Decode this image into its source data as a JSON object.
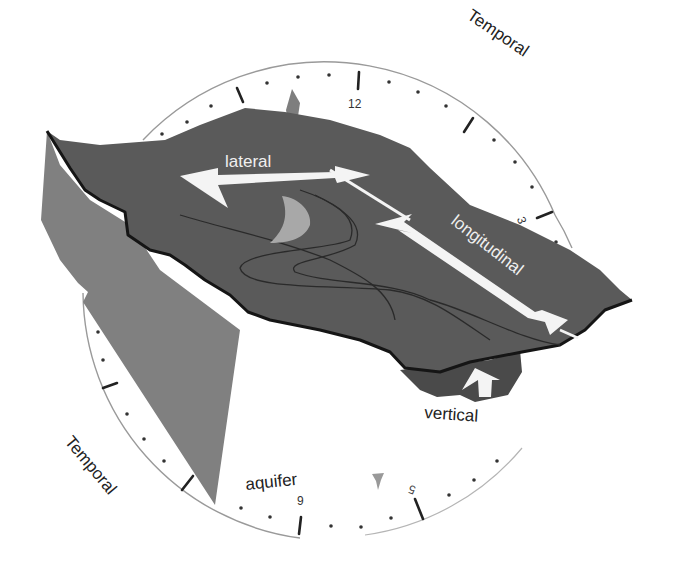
{
  "diagram": {
    "labels": {
      "temporal_top": "Temporal",
      "temporal_bottom": "Temporal",
      "lateral": "lateral",
      "longitudinal": "longitudinal",
      "vertical": "vertical",
      "aquifer": "aquifer"
    },
    "clock": {
      "numbers": {
        "n11": "11",
        "n12": "12",
        "n1": "1",
        "n2": "2",
        "n3": "3",
        "n4": "4",
        "n5": "5",
        "n6": "6",
        "n7": "7",
        "n8": "8",
        "n9": "9",
        "n10": "10"
      },
      "visible_numbers": [
        "11",
        "12",
        "3",
        "5",
        "9"
      ]
    },
    "colors": {
      "background": "#ffffff",
      "terrain_top": "#5a5a5a",
      "terrain_side": "#808080",
      "channel_highlight": "#a8a8a8",
      "arrow": "#f4f4f4",
      "outline": "#1a1a1a",
      "clock_rim": "#9a9a9a",
      "label_dark": "#222222",
      "label_light": "#f0f0f0"
    }
  }
}
